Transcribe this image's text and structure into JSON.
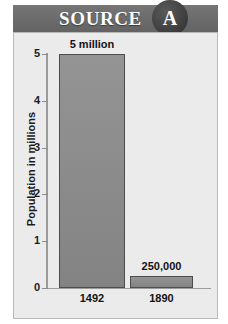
{
  "header": {
    "title": "SOURCE",
    "badge_letter": "A",
    "band_color": "#6e6e6e",
    "badge_color": "#3d3d3d",
    "title_color": "#ffffff"
  },
  "panel": {
    "background_color": "#ebebeb",
    "border_color": "#b9b9b9"
  },
  "chart_data": {
    "type": "bar",
    "title": "",
    "xlabel": "",
    "ylabel": "Population in millions",
    "categories": [
      "1492",
      "1890"
    ],
    "values": [
      5,
      0.25
    ],
    "data_labels": [
      "5 million",
      "250,000"
    ],
    "ylim": [
      0,
      5
    ],
    "yticks": [
      0,
      1,
      2,
      3,
      4,
      5
    ],
    "ytick_labels": [
      "0",
      "1",
      "2",
      "3",
      "4",
      "5"
    ],
    "grid": false,
    "legend": false,
    "bar_fill_color": "#8c8c8c",
    "bar_border_color": "#4c4c4c"
  }
}
